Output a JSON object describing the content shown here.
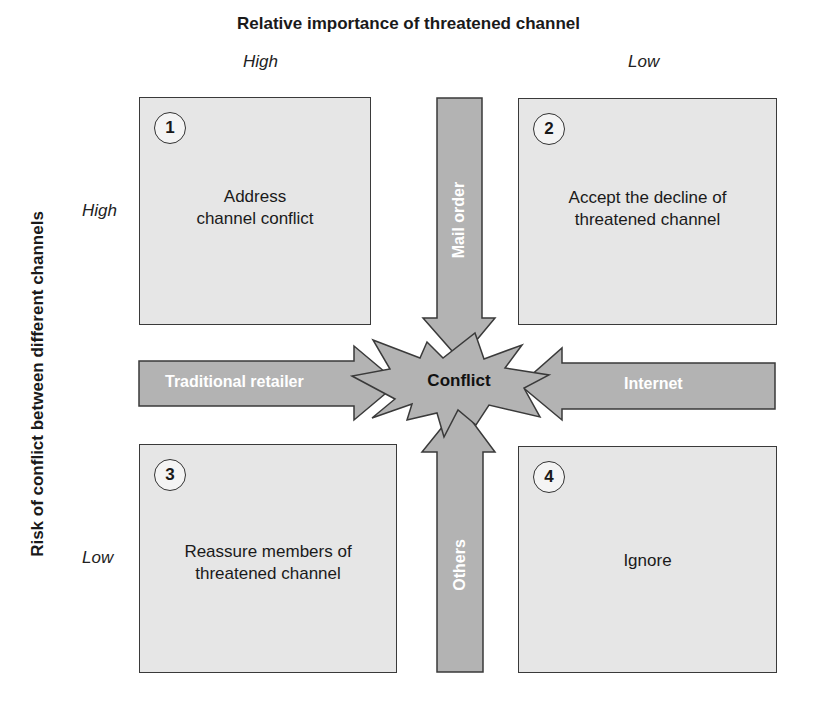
{
  "title": "Relative importance of threatened channel",
  "x_axis": {
    "high_label": "High",
    "low_label": "Low"
  },
  "y_axis": {
    "label": "Risk of conflict between different channels",
    "high_label": "High",
    "low_label": "Low"
  },
  "quadrants": [
    {
      "number": "1",
      "line1": "Address",
      "line2": "channel conflict"
    },
    {
      "number": "2",
      "line1": "Accept the decline of",
      "line2": "threatened channel"
    },
    {
      "number": "3",
      "line1": "Reassure members of",
      "line2": "threatened channel"
    },
    {
      "number": "4",
      "line1": "Ignore",
      "line2": ""
    }
  ],
  "arrows": {
    "top": "Mail order",
    "left": "Traditional retailer",
    "right": "Internet",
    "bottom": "Others"
  },
  "center": "Conflict",
  "colors": {
    "box_fill": "#e6e6e6",
    "arrow_fill": "#b3b3b3",
    "outline": "#3a3a3a",
    "arrow_text": "#ffffff"
  }
}
